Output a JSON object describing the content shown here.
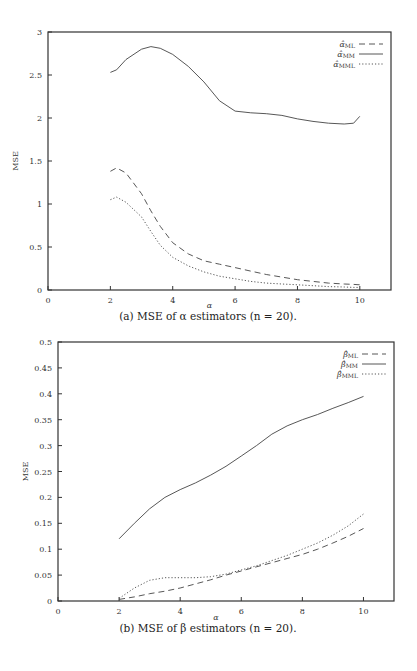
{
  "chart_data": [
    {
      "type": "line",
      "title": "",
      "caption": "(a)  MSE of α estimators (n = 20).",
      "xlabel": "α",
      "ylabel": "MSE",
      "xlim": [
        0,
        11
      ],
      "ylim": [
        0,
        3
      ],
      "xticks": [
        "0",
        "2",
        "4",
        "6",
        "8",
        "10"
      ],
      "yticks": [
        "0",
        "0.5",
        "1",
        "1.5",
        "2",
        "2.5",
        "3"
      ],
      "grid": false,
      "legend_position": "top-right",
      "x": [
        2,
        2.2,
        2.5,
        3,
        3.3,
        3.6,
        4,
        4.5,
        5,
        5.5,
        6,
        6.5,
        7,
        7.5,
        8,
        8.5,
        9,
        9.5,
        9.8,
        10
      ],
      "series": [
        {
          "name": "α̂ML",
          "style": "dashed",
          "values": [
            1.38,
            1.42,
            1.36,
            1.12,
            0.92,
            0.74,
            0.55,
            0.42,
            0.34,
            0.3,
            0.26,
            0.22,
            0.18,
            0.15,
            0.12,
            0.1,
            0.08,
            0.07,
            0.065,
            0.06
          ]
        },
        {
          "name": "α̂MM",
          "style": "solid",
          "values": [
            2.53,
            2.56,
            2.68,
            2.8,
            2.83,
            2.81,
            2.74,
            2.6,
            2.42,
            2.2,
            2.08,
            2.06,
            2.05,
            2.03,
            1.99,
            1.96,
            1.94,
            1.93,
            1.94,
            2.02
          ]
        },
        {
          "name": "α̂MML",
          "style": "dotted",
          "values": [
            1.05,
            1.08,
            1.02,
            0.85,
            0.68,
            0.52,
            0.38,
            0.28,
            0.21,
            0.16,
            0.13,
            0.1,
            0.08,
            0.07,
            0.06,
            0.05,
            0.04,
            0.035,
            0.03,
            0.03
          ]
        }
      ]
    },
    {
      "type": "line",
      "title": "",
      "caption": "(b)  MSE of β estimators (n = 20).",
      "xlabel": "α",
      "ylabel": "MSE",
      "xlim": [
        0,
        11
      ],
      "ylim": [
        0,
        0.5
      ],
      "xticks": [
        "0",
        "2",
        "4",
        "6",
        "8",
        "10"
      ],
      "yticks": [
        "0",
        "0.05",
        "0.1",
        "0.15",
        "0.2",
        "0.25",
        "0.3",
        "0.35",
        "0.4",
        "0.45",
        "0.5"
      ],
      "grid": false,
      "legend_position": "top-right",
      "x": [
        2,
        2.5,
        3,
        3.5,
        4,
        4.5,
        5,
        5.5,
        6,
        6.5,
        7,
        7.5,
        8,
        8.5,
        9,
        9.5,
        10
      ],
      "series": [
        {
          "name": "β̂ML",
          "style": "dashed",
          "values": [
            0.003,
            0.008,
            0.014,
            0.019,
            0.025,
            0.033,
            0.041,
            0.05,
            0.058,
            0.066,
            0.074,
            0.082,
            0.09,
            0.1,
            0.112,
            0.125,
            0.14
          ]
        },
        {
          "name": "β̂MM",
          "style": "solid",
          "values": [
            0.12,
            0.15,
            0.178,
            0.2,
            0.215,
            0.228,
            0.243,
            0.26,
            0.28,
            0.3,
            0.322,
            0.338,
            0.35,
            0.36,
            0.372,
            0.383,
            0.395
          ]
        },
        {
          "name": "β̂MML",
          "style": "dotted",
          "values": [
            0.005,
            0.025,
            0.04,
            0.045,
            0.045,
            0.045,
            0.047,
            0.052,
            0.06,
            0.068,
            0.078,
            0.088,
            0.1,
            0.112,
            0.127,
            0.145,
            0.168
          ]
        }
      ]
    }
  ],
  "panels": {
    "a": {
      "caption": "(a)  MSE of α estimators (n = 20).",
      "ylabel": "MSE",
      "xlabel": "α",
      "legend": [
        {
          "base": "α̂",
          "sub": "ML"
        },
        {
          "base": "α̂",
          "sub": "MM"
        },
        {
          "base": "α̂",
          "sub": "MML"
        }
      ]
    },
    "b": {
      "caption": "(b)  MSE of β estimators (n = 20).",
      "ylabel": "MSE",
      "xlabel": "α",
      "legend": [
        {
          "base": "β̂",
          "sub": "ML"
        },
        {
          "base": "β̂",
          "sub": "MM"
        },
        {
          "base": "β̂",
          "sub": "MML"
        }
      ]
    }
  }
}
